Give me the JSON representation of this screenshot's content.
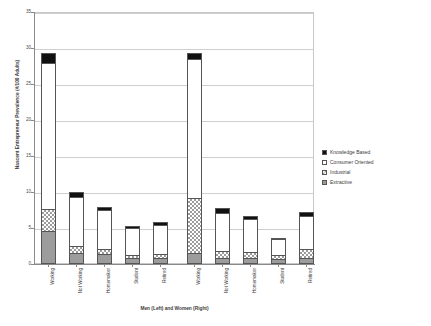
{
  "chart_data": {
    "type": "bar",
    "stacked": true,
    "title": "",
    "xlabel": "Men (Left) and Women (Right)",
    "ylabel": "Nascent Entrepreneur Prevalence (#/100 Adults)",
    "ylim": [
      0,
      35
    ],
    "ytick_labels": [
      "0",
      "5",
      "10",
      "15",
      "20",
      "25",
      "30",
      "35"
    ],
    "ytick_values": [
      0,
      5,
      10,
      15,
      20,
      25,
      30,
      35
    ],
    "grid": true,
    "legend_position": "right",
    "categories": [
      "Working",
      "Not Working",
      "Homemaker",
      "Student",
      "Retired",
      "Working",
      "Not Working",
      "Homemaker",
      "Student",
      "Retired"
    ],
    "groups": [
      {
        "name": "Men",
        "categories": [
          "Working",
          "Not Working",
          "Homemaker",
          "Student",
          "Retired"
        ]
      },
      {
        "name": "Women",
        "categories": [
          "Working",
          "Not Working",
          "Homemaker",
          "Student",
          "Retired"
        ]
      }
    ],
    "series": [
      {
        "name": "Extractive",
        "color": "#9c9c9c",
        "pattern": "solid-gray",
        "values": [
          4.3,
          1.3,
          1.1,
          0.5,
          0.6,
          1.3,
          0.5,
          0.5,
          0.4,
          0.5
        ]
      },
      {
        "name": "Industrial",
        "color": "#ffffff",
        "pattern": "checkered",
        "values": [
          3.0,
          0.9,
          0.7,
          0.5,
          0.5,
          7.6,
          1.0,
          0.9,
          0.6,
          1.3
        ]
      },
      {
        "name": "Consumer Oriented",
        "color": "#ffffff",
        "pattern": "open",
        "values": [
          20.4,
          6.8,
          5.4,
          3.7,
          4.0,
          19.3,
          5.3,
          4.6,
          2.2,
          4.6
        ]
      },
      {
        "name": "Knowledge Based",
        "color": "#111111",
        "pattern": "solid-black",
        "values": [
          1.3,
          0.7,
          0.5,
          0.3,
          0.4,
          0.8,
          0.7,
          0.4,
          0.2,
          0.6
        ]
      }
    ],
    "totals": [
      29.0,
      9.7,
      7.7,
      5.0,
      5.5,
      29.0,
      7.5,
      6.4,
      3.4,
      7.0
    ]
  },
  "legend": {
    "entries": [
      {
        "label": "Knowledge Based"
      },
      {
        "label": "Consumer Oriented"
      },
      {
        "label": "Industrial"
      },
      {
        "label": "Extractive"
      }
    ]
  }
}
